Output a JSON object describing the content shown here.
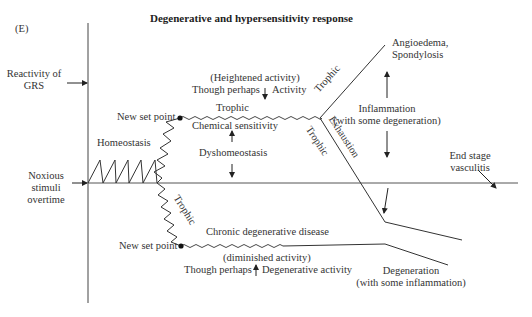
{
  "figure": {
    "panel_label": "(E)",
    "title": "Degenerative and hypersensitivity response"
  },
  "axes": {
    "y_axis_label": [
      "Reactivity of",
      "GRS"
    ],
    "x_axis_label": [
      "Noxious",
      "stimuli",
      "overtime"
    ]
  },
  "labels": {
    "homeostasis": "Homeostasis",
    "upper_set_point": "New set point",
    "lower_set_point": "New set point",
    "heightened_activity": "(Heightened activity)",
    "though_perhaps_upper": "Though perhaps",
    "activity": "Activity",
    "trophic_upper_flat": "Trophic",
    "chemical_sensitivity": "Chemical sensitivity",
    "dyshomeostasis": "Dyshomeostasis",
    "trophic_branch_up": "Trophic",
    "trophic_branch_down": "Trophic",
    "exhaustion": "Exhaustion",
    "trophic_descent": "Trophic",
    "angioedema": [
      "Angioedema,",
      "Spondylosis"
    ],
    "inflammation": [
      "Inflammation",
      "(with some degeneration)"
    ],
    "end_stage": [
      "End stage",
      "vasculitis"
    ],
    "chronic_degenerative": "Chronic degenerative disease",
    "diminished_activity": "(diminished activity)",
    "though_perhaps_lower": "Though perhaps",
    "degenerative_activity": "Degenerative activity",
    "degeneration": [
      "Degeneration",
      "(with some inflammation)"
    ]
  },
  "colors": {
    "line": "#333333",
    "text": "#333333",
    "background": "#ffffff"
  }
}
